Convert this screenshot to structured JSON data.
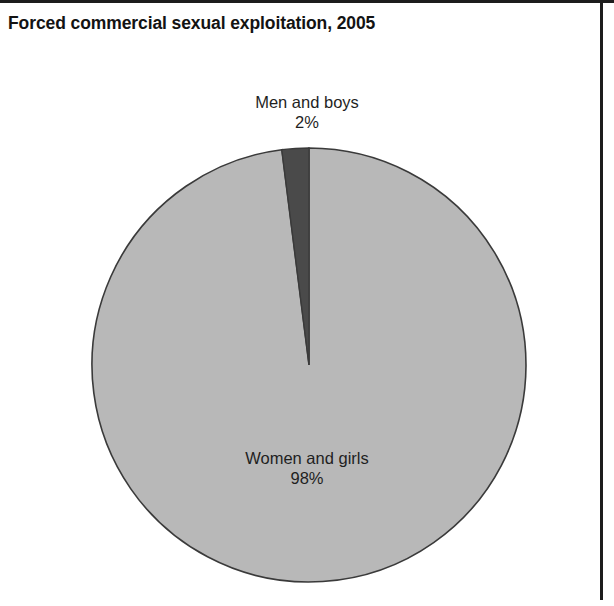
{
  "chart_data": {
    "type": "pie",
    "title": "Forced commercial sexual exploitation, 2005",
    "xlabel": "",
    "ylabel": "",
    "legend_position": "none",
    "grid": false,
    "labels": [
      "Women and girls",
      "Men and boys"
    ],
    "values": [
      98,
      2
    ],
    "value_suffix": "%",
    "slices": [
      {
        "label": "Women and girls",
        "value": 98,
        "value_label": "98%",
        "color": "#b8b8b8",
        "start_angle_deg": 0,
        "end_angle_deg": 352.8
      },
      {
        "label": "Men and boys",
        "value": 2,
        "value_label": "2%",
        "color": "#4a4a4a",
        "start_angle_deg": 352.8,
        "end_angle_deg": 360
      }
    ],
    "annotations": [
      {
        "name": "Men and boys",
        "value_label": "2%",
        "position": "above-pie"
      },
      {
        "name": "Women and girls",
        "value_label": "98%",
        "position": "inside-slice"
      }
    ],
    "outline_color": "#3a3a3a"
  },
  "figure": {
    "title": "Forced commercial sexual exploitation, 2005",
    "background": "#ffffff",
    "frame_color": "#1d1d1d"
  },
  "labels": {
    "men": {
      "name": "Men and boys",
      "pct": "2%"
    },
    "women": {
      "name": "Women and girls",
      "pct": "98%"
    }
  }
}
